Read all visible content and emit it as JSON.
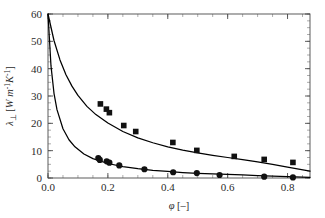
{
  "chart_data": {
    "type": "scatter",
    "title": "",
    "xlabel": "φ [–]",
    "ylabel": "λ⊥ [W m⁻¹K⁻¹]",
    "ylabel_parts": {
      "symbol": "λ",
      "subscript": "⊥",
      "unit_open": " [",
      "unit_w": "W",
      "unit_m": "m",
      "unit_m_exp": "-1",
      "unit_k": "K",
      "unit_k_exp": "-1",
      "unit_close": "]"
    },
    "xlabel_parts": {
      "symbol": "φ",
      "unit": " [–]"
    },
    "xlim": [
      0.0,
      0.875
    ],
    "ylim": [
      0,
      60
    ],
    "xticks": [
      0.0,
      0.2,
      0.4,
      0.6,
      0.8
    ],
    "xtick_labels": [
      "0.0",
      "0.2",
      "0.4",
      "0.6",
      "0.8"
    ],
    "yticks": [
      0,
      10,
      20,
      30,
      40,
      50,
      60
    ],
    "ytick_labels": [
      "0",
      "10",
      "20",
      "30",
      "40",
      "50",
      "60"
    ],
    "x_minor_step": 0.05,
    "y_minor_step": 2.5,
    "grid": false,
    "legend": "none",
    "frame": "box",
    "marker_colors": {
      "square": "#111111",
      "circle": "#111111",
      "curve": "#000000",
      "frame": "#4a4a4a"
    },
    "series": [
      {
        "name": "upper-data",
        "marker": "square",
        "x": [
          0.175,
          0.195,
          0.205,
          0.253,
          0.293,
          0.417,
          0.497,
          0.622,
          0.722,
          0.818
        ],
        "y": [
          27.1,
          25.2,
          23.9,
          19.2,
          17.0,
          13.0,
          10.1,
          7.9,
          6.8,
          5.7
        ]
      },
      {
        "name": "lower-data",
        "marker": "circle",
        "x": [
          0.168,
          0.173,
          0.196,
          0.205,
          0.238,
          0.322,
          0.418,
          0.497,
          0.573,
          0.722,
          0.818
        ],
        "y": [
          7.3,
          6.6,
          6.1,
          5.6,
          4.6,
          3.2,
          2.1,
          1.8,
          1.1,
          0.5,
          0.2
        ]
      },
      {
        "name": "upper-model-curve",
        "marker": "line",
        "x": [
          0.0,
          0.02,
          0.04,
          0.06,
          0.08,
          0.1,
          0.13,
          0.16,
          0.2,
          0.25,
          0.3,
          0.35,
          0.4,
          0.45,
          0.5,
          0.55,
          0.6,
          0.65,
          0.7,
          0.75,
          0.8,
          0.875
        ],
        "y": [
          60.0,
          50.3,
          43.2,
          37.8,
          33.6,
          30.2,
          26.2,
          23.2,
          20.1,
          17.0,
          14.7,
          12.9,
          11.4,
          10.2,
          9.2,
          8.3,
          7.5,
          6.7,
          5.9,
          5.0,
          4.0,
          2.5
        ]
      },
      {
        "name": "lower-model-curve",
        "marker": "line",
        "x": [
          0.0,
          0.01,
          0.02,
          0.03,
          0.05,
          0.07,
          0.09,
          0.12,
          0.15,
          0.2,
          0.25,
          0.3,
          0.35,
          0.4,
          0.45,
          0.5,
          0.55,
          0.6,
          0.65,
          0.7,
          0.75,
          0.8,
          0.875
        ],
        "y": [
          60.0,
          41.0,
          31.0,
          25.0,
          18.0,
          14.0,
          11.4,
          8.8,
          7.1,
          5.3,
          4.2,
          3.4,
          2.8,
          2.4,
          2.0,
          1.7,
          1.5,
          1.3,
          1.1,
          0.9,
          0.7,
          0.5,
          0.25
        ]
      }
    ]
  }
}
